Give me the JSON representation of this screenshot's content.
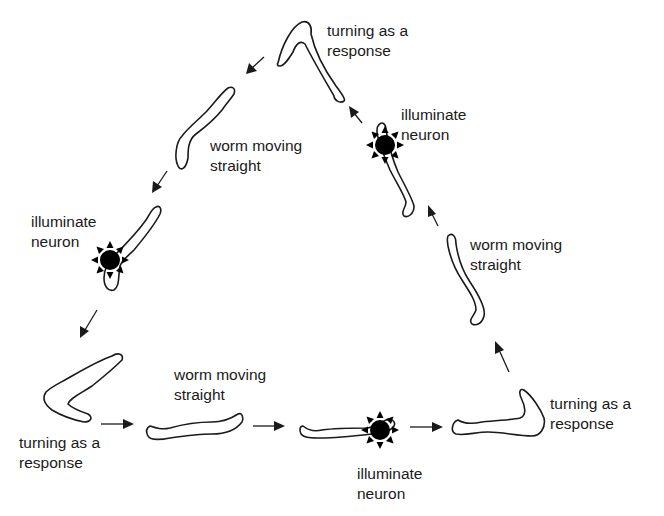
{
  "diagram": {
    "type": "cycle",
    "shape": "triangle",
    "direction": "counter-clockwise",
    "colors": {
      "stroke": "#1a1a1a",
      "background": "#ffffff",
      "light": "#000000"
    },
    "stages": [
      {
        "id": "top-turn",
        "line1": "turning as a",
        "line2": "response"
      },
      {
        "id": "left-straight",
        "line1": "worm moving",
        "line2": "straight"
      },
      {
        "id": "left-illuminate",
        "line1": "illuminate",
        "line2": "neuron"
      },
      {
        "id": "bottom-left-turn",
        "line1": "turning as a",
        "line2": "response"
      },
      {
        "id": "bottom-straight",
        "line1": "worm moving",
        "line2": "straight"
      },
      {
        "id": "bottom-illuminate",
        "line1": "illuminate",
        "line2": "neuron"
      },
      {
        "id": "bottom-right-turn",
        "line1": "turning as a",
        "line2": "response"
      },
      {
        "id": "right-straight",
        "line1": "worm moving",
        "line2": "straight"
      },
      {
        "id": "right-illuminate",
        "line1": "illuminate",
        "line2": "neuron"
      }
    ],
    "icons": {
      "worm": "worm-outline-icon",
      "light": "light-burst-icon",
      "arrow": "arrow-icon"
    }
  }
}
